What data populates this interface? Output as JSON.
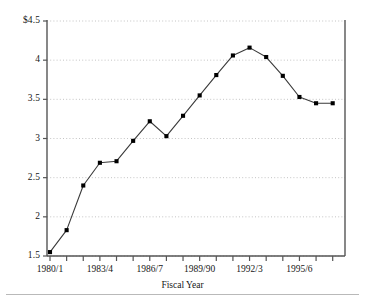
{
  "chart_data": {
    "type": "line",
    "title": "",
    "subtitle": "",
    "xlabel": "Fiscal Year",
    "ylabel": "",
    "categories": [
      "1980/1",
      "1981/2",
      "1982/3",
      "1983/4",
      "1984/5",
      "1985/6",
      "1986/7",
      "1987/8",
      "1988/9",
      "1989/90",
      "1990/1",
      "1991/2",
      "1992/3",
      "1993/4",
      "1994/5",
      "1995/6",
      "1996/7",
      "1997/8"
    ],
    "values": [
      1.55,
      1.83,
      2.4,
      2.69,
      2.71,
      2.97,
      3.22,
      3.03,
      3.29,
      3.55,
      3.81,
      4.06,
      4.16,
      4.04,
      3.8,
      3.53,
      3.45,
      3.45
    ],
    "ylim": [
      1.5,
      4.5
    ],
    "ytick_values": [
      1.5,
      2,
      2.5,
      3,
      3.5,
      4,
      4.5
    ],
    "ytick_labels": [
      "1.5",
      "2",
      "2.5",
      "3",
      "3.5",
      "4",
      "$4.5"
    ],
    "xtick_labeled": [
      {
        "index": 0,
        "label": "1980/1"
      },
      {
        "index": 3,
        "label": "1983/4"
      },
      {
        "index": 6,
        "label": "1986/7"
      },
      {
        "index": 9,
        "label": "1989/90"
      },
      {
        "index": 12,
        "label": "1992/3"
      },
      {
        "index": 15,
        "label": "1995/6"
      }
    ],
    "grid": "horizontal-dotted",
    "legend": "none",
    "marker": "square",
    "line_color": "#3a3a3a",
    "marker_color": "#000000",
    "grid_color": "#b5b5b5",
    "axis_color": "#555555"
  }
}
